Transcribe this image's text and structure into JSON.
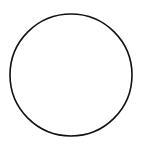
{
  "canvas": {
    "width": 142,
    "height": 143,
    "background": "#ffffff"
  },
  "shape": {
    "type": "circle",
    "cx": 71,
    "cy": 75,
    "r": 61,
    "stroke": "#111111",
    "stroke_width": 1.6,
    "fill": "none"
  }
}
